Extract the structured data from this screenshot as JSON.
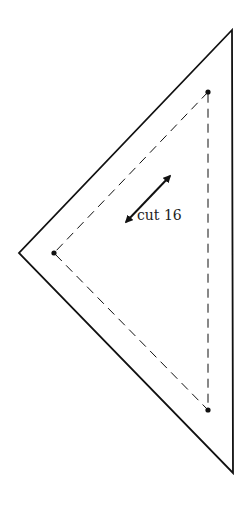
{
  "diagram": {
    "label": "cut 16",
    "colors": {
      "stroke": "#111111",
      "background": "#ffffff"
    },
    "outer_triangle": [
      [
        232,
        30
      ],
      [
        19,
        253
      ],
      [
        233,
        473
      ]
    ],
    "seam_triangle": [
      [
        208,
        92
      ],
      [
        54,
        253
      ],
      [
        208,
        410
      ]
    ],
    "grain_arrow": {
      "from": [
        124,
        224
      ],
      "to": [
        172,
        174
      ]
    }
  }
}
